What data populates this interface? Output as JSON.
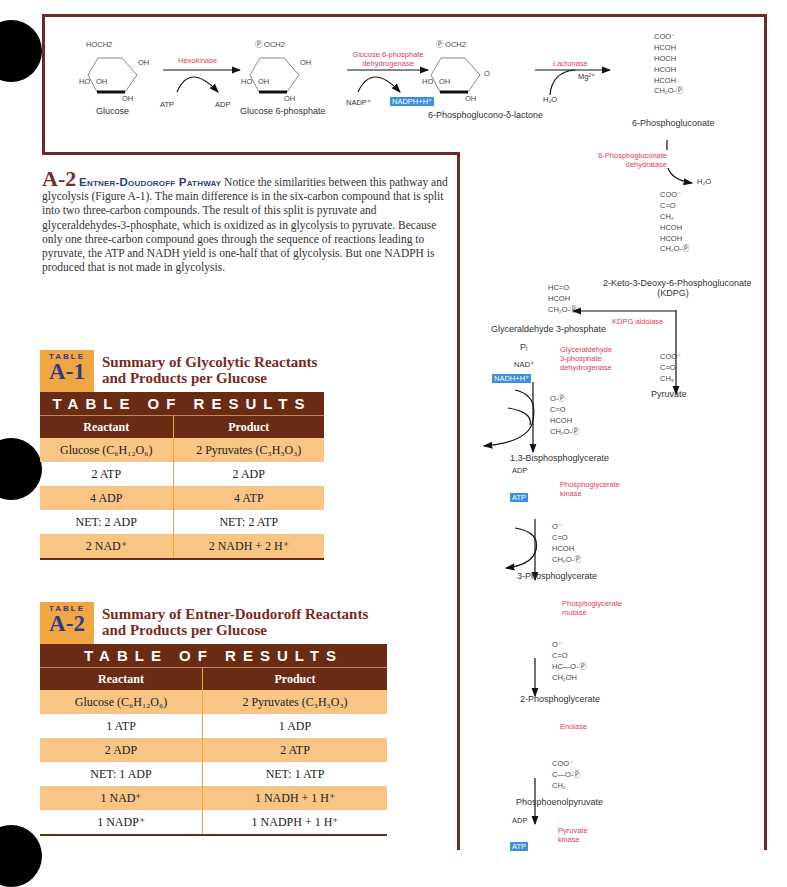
{
  "figure_top": {
    "compounds": [
      {
        "name": "Glucose",
        "substituents": [
          "HOCH2",
          "OH",
          "HO",
          "OH",
          "OH"
        ]
      },
      {
        "name": "Glucose 6-phosphate",
        "substituents": [
          "Ⓟ OCH2",
          "OH",
          "HO",
          "OH",
          "OH"
        ]
      },
      {
        "name": "6-Phosphoglucono-δ-lactone",
        "substituents": [
          "Ⓟ OCH2",
          "O",
          "HO",
          "OH",
          "OH"
        ]
      },
      {
        "name": "6-Phosphogluconate",
        "lines": [
          "COO⁻",
          "HCOH",
          "HOCH",
          "HCOH",
          "HCOH",
          "CH₂O-Ⓟ"
        ]
      }
    ],
    "reactions": [
      {
        "enzyme": "Hexokinase",
        "in": "ATP",
        "out": "ADP"
      },
      {
        "enzyme_line1": "Glucose 6-phosphate",
        "enzyme_line2": "dehydrogenase",
        "in": "NADP⁺",
        "out": "NADPH+H⁺"
      },
      {
        "enzyme": "Lactonase",
        "in": "H₂O",
        "cofactor": "Mg²⁺"
      }
    ]
  },
  "section": {
    "number": "A-2",
    "title": "Entner-Doudoroff Pathway",
    "body": "Notice the similarities between this pathway and glycolysis (Figure A-1). The main difference is in the six-carbon compound that is split into two three-carbon compounds. The result of this split is pyruvate and glyceraldehydes-3-phosphate, which is oxidized as in glycolysis to pyruvate. Because only one three-carbon compound goes through the sequence of reactions leading to pyruvate, the ATP and NADH yield is one-half that of glycolysis. But one NADPH is produced that is not made in glycolysis."
  },
  "pathway": {
    "step1": {
      "enzyme_line1": "6-Phosphogluconate",
      "enzyme_line2": "dehydratase",
      "out": "H₂O"
    },
    "kdpg": {
      "lines": [
        "COO⁻",
        "C=O",
        "CH₂",
        "HCOH",
        "HCOH",
        "CH₂O-Ⓟ"
      ],
      "name_line1": "2-Keto-3-Deoxy-6-Phosphogluconate",
      "name_line2": "(KDPG)"
    },
    "aldolase": "KDPG aldolase",
    "g3p": {
      "lines": [
        "HC=O",
        "HCOH",
        "CH₂O-Ⓟ"
      ],
      "name": "Glyceraldehyde 3-phosphate"
    },
    "pyruvate": {
      "lines": [
        "COO⁻",
        "C=O",
        "CH₃"
      ],
      "name": "Pyruvate"
    },
    "g3pdh": {
      "in1": "Pᵢ",
      "in2": "NAD⁺",
      "out": "NADH+H⁺",
      "enzyme": [
        "Glyceraldehyde",
        "3-phosphate",
        "dehydrogenase"
      ]
    },
    "bpg": {
      "lines": [
        "O-Ⓟ",
        "C=O",
        "HCOH",
        "CH₂O-Ⓟ"
      ],
      "name": "1,3-Bisphosphoglycerate"
    },
    "pgk": {
      "in": "ADP",
      "out": "ATP",
      "enzyme": [
        "Phosphoglycerate",
        "kinase"
      ]
    },
    "pg3": {
      "lines": [
        "O⁻",
        "C=O",
        "HCOH",
        "CH₂O-Ⓟ"
      ],
      "name": "3-Phosphoglycerate"
    },
    "mutase": [
      "Phosphoglycerate",
      "mutase"
    ],
    "pg2": {
      "lines": [
        "O⁻",
        "C=O",
        "HC—O-Ⓟ",
        "CH₂OH"
      ],
      "name": "2-Phosphoglycerate"
    },
    "enolase": "Enolase",
    "pep": {
      "lines": [
        "COO⁻",
        "C—O-Ⓟ",
        "CH₂"
      ],
      "name": "Phosphoenolpyruvate"
    },
    "pk": {
      "in": "ADP",
      "out": "ATP",
      "enzyme": [
        "Pyruvate",
        "kinase"
      ]
    }
  },
  "table1": {
    "badge_small": "TABLE",
    "badge_big": "A-1",
    "title_line1": "Summary of Glycolytic Reactants",
    "title_line2": "and Products per Glucose",
    "banner": "TABLE OF RESULTS",
    "headers": [
      "Reactant",
      "Product"
    ],
    "rows": [
      [
        "Glucose (C₆H₁₂O₆)",
        "2 Pyruvates (C₃H₃O₃)"
      ],
      [
        "2 ATP",
        "2 ADP"
      ],
      [
        "4 ADP",
        "4 ATP"
      ],
      [
        "NET: 2 ADP",
        "NET: 2 ATP"
      ],
      [
        "2 NAD⁺",
        "2 NADH + 2 H⁺"
      ]
    ]
  },
  "table2": {
    "badge_small": "TABLE",
    "badge_big": "A-2",
    "title_line1": "Summary of Entner-Doudoroff Reactants",
    "title_line2": "and Products per Glucose",
    "banner": "TABLE OF RESULTS",
    "headers": [
      "Reactant",
      "Product"
    ],
    "rows": [
      [
        "Glucose (C₆H₁₂O₆)",
        "2 Pyruvates (C₃H₃O₃)"
      ],
      [
        "1 ATP",
        "1 ADP"
      ],
      [
        "2 ADP",
        "2 ATP"
      ],
      [
        "NET: 1 ADP",
        "NET: 1 ATP"
      ],
      [
        "1 NAD⁺",
        "1 NADH + 1 H⁺"
      ],
      [
        "1 NADP⁺",
        "1 NADPH + 1 H⁺"
      ]
    ]
  }
}
